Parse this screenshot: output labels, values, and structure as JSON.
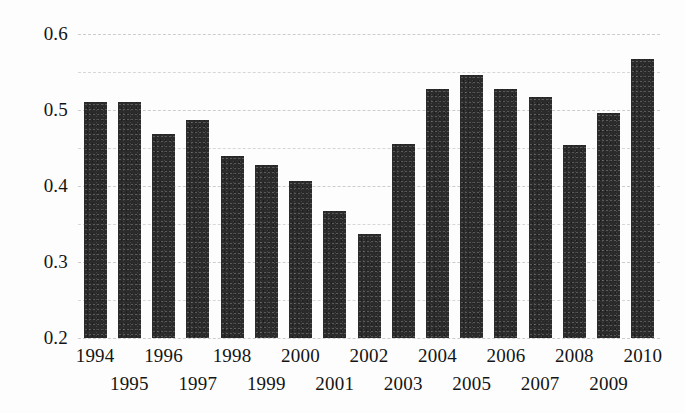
{
  "chart_data": {
    "type": "bar",
    "title": "",
    "subtitle": "",
    "xlabel": "",
    "ylabel": "",
    "categories": [
      "1994",
      "1995",
      "1996",
      "1997",
      "1998",
      "1999",
      "2000",
      "2001",
      "2002",
      "2003",
      "2004",
      "2005",
      "2006",
      "2007",
      "2008",
      "2009",
      "2010"
    ],
    "values": [
      0.51,
      0.51,
      0.468,
      0.487,
      0.44,
      0.427,
      0.407,
      0.367,
      0.337,
      0.455,
      0.528,
      0.546,
      0.528,
      0.517,
      0.454,
      0.496,
      0.567
    ],
    "ylim": [
      0.2,
      0.6
    ],
    "xlim_note": "categorical",
    "y_tick_labels": [
      "0.6",
      "0.5",
      "0.4",
      "0.3",
      "0.2"
    ],
    "y_tick_values": [
      0.6,
      0.5,
      0.4,
      0.3,
      0.2
    ],
    "gridlines": [
      0.6,
      0.55,
      0.5,
      0.45,
      0.4,
      0.35,
      0.3,
      0.25,
      0.2
    ],
    "grid": true,
    "grid_style": "dashed",
    "legend": [],
    "legend_position": "none",
    "annotations": [],
    "x_label_rows": {
      "top": [
        "1994",
        "1996",
        "1998",
        "2000",
        "2002",
        "2004",
        "2006",
        "2008",
        "2010"
      ],
      "bottom": [
        "1995",
        "1997",
        "1999",
        "2001",
        "2003",
        "2005",
        "2007",
        "2009"
      ]
    },
    "colors": {
      "bar": "#2c2b2b",
      "grid": "#d7d7d7",
      "text": "#141414",
      "background": "#fdfdfd"
    }
  }
}
